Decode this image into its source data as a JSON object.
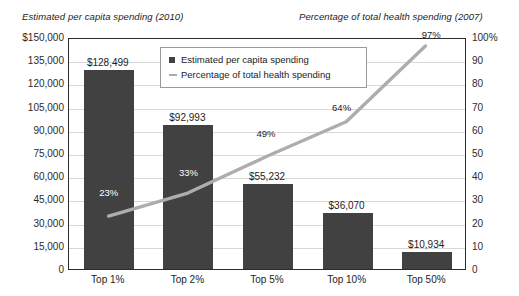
{
  "titles": {
    "left_axis": "Estimated per capita spending (2010)",
    "right_axis": "Percentage of total health spending (2007)"
  },
  "legend": {
    "items": [
      {
        "label": "Estimated per capita spending",
        "marker": "square-marker",
        "color": "#414141"
      },
      {
        "label": "Percentage of total health spending",
        "marker": "line-marker",
        "color": "#adadad"
      }
    ]
  },
  "axes": {
    "left_ticks": [
      "$150,000",
      "135,000",
      "120,000",
      "105,000",
      "90,000",
      "75,000",
      "60,000",
      "45,000",
      "30,000",
      "15,000",
      "0"
    ],
    "right_ticks": [
      "100%",
      "90",
      "80",
      "70",
      "60",
      "50",
      "40",
      "30",
      "20",
      "10",
      "0"
    ]
  },
  "chart_data": {
    "type": "bar",
    "title": "",
    "categories": [
      "Top 1%",
      "Top 2%",
      "Top 5%",
      "Top 10%",
      "Top 50%"
    ],
    "series": [
      {
        "name": "Estimated per capita spending",
        "type": "bar",
        "axis": "left",
        "color": "#414141",
        "values": [
          128499,
          92993,
          55232,
          36070,
          10934
        ],
        "labels": [
          "$128,499",
          "$92,993",
          "$55,232",
          "$36,070",
          "$10,934"
        ]
      },
      {
        "name": "Percentage of total health spending",
        "type": "line",
        "axis": "right",
        "color": "#adadad",
        "values": [
          23,
          33,
          49,
          64,
          97
        ],
        "labels": [
          "23%",
          "33%",
          "49%",
          "64%",
          "97%"
        ]
      }
    ],
    "xlabel": "",
    "ylabel": "Estimated per capita spending (2010)",
    "y2label": "Percentage of total health spending (2007)",
    "ylim": [
      0,
      150000
    ],
    "y2lim": [
      0,
      100
    ],
    "ytick_step": 15000,
    "y2tick_step": 10,
    "grid": true,
    "legend_position": "top-center"
  }
}
